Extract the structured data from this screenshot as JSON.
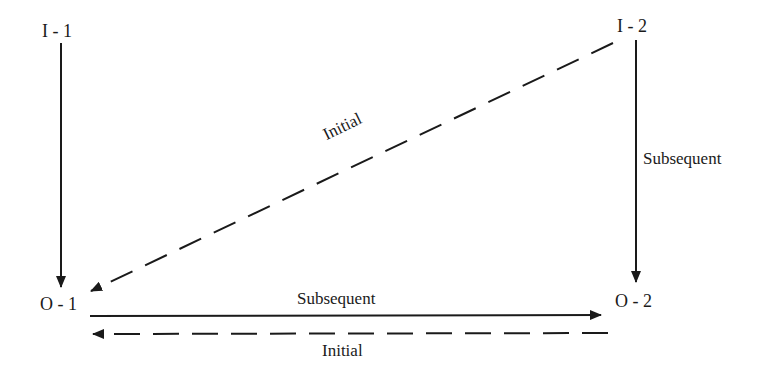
{
  "diagram": {
    "nodes": {
      "i1": {
        "label": "I - 1"
      },
      "i2": {
        "label": "I - 2"
      },
      "o1": {
        "label": "O - 1"
      },
      "o2": {
        "label": "O - 2"
      }
    },
    "edges": [
      {
        "from": "I - 1",
        "to": "O - 1",
        "style": "solid",
        "label": ""
      },
      {
        "from": "I - 2",
        "to": "O - 1",
        "style": "dashed",
        "label": "Initial"
      },
      {
        "from": "I - 2",
        "to": "O - 2",
        "style": "solid",
        "label": "Subsequent"
      },
      {
        "from": "O - 1",
        "to": "O - 2",
        "style": "solid",
        "label": "Subsequent"
      },
      {
        "from": "O - 2",
        "to": "O - 1",
        "style": "dashed",
        "label": "Initial"
      }
    ],
    "labels": {
      "diagonal_initial": "Initial",
      "right_subsequent": "Subsequent",
      "bottom_subsequent": "Subsequent",
      "bottom_initial": "Initial"
    },
    "colors": {
      "line": "#1a1a1a",
      "background": "#ffffff"
    }
  }
}
